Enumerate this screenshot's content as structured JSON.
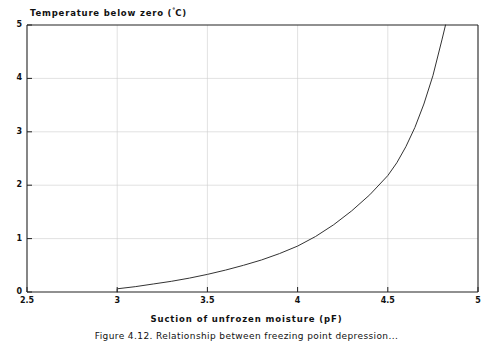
{
  "figure": {
    "caption": "Figure 4.12.  Relationship between freezing point depression..."
  },
  "chart_data": {
    "type": "line",
    "title": "",
    "xlabel": "Suction of unfrozen moisture (pF)",
    "ylabel": "Temperature below zero (°C)",
    "ylabel_text": "Temperature below zero (",
    "ylabel_unit": "C)",
    "ylabel_degree": "°",
    "xlim": [
      2.5,
      5
    ],
    "ylim": [
      0,
      5
    ],
    "xticks": [
      "2.5",
      "3",
      "3.5",
      "4",
      "4.5",
      "5"
    ],
    "xtick_values": [
      2.5,
      3,
      3.5,
      4,
      4.5,
      5
    ],
    "yticks": [
      "0",
      "1",
      "2",
      "3",
      "4",
      "5"
    ],
    "ytick_values": [
      0,
      1,
      2,
      3,
      4,
      5
    ],
    "grid": true,
    "grid_color": "#cccccc",
    "line_color": "#333333",
    "axis_color": "#222222",
    "legend": null,
    "series": [
      {
        "name": "freezing point depression",
        "x": [
          3.0,
          3.0,
          3.1,
          3.2,
          3.3,
          3.4,
          3.5,
          3.6,
          3.7,
          3.8,
          3.9,
          4.0,
          4.1,
          4.2,
          4.3,
          4.4,
          4.5,
          4.55,
          4.6,
          4.65,
          4.7,
          4.75,
          4.8,
          4.82
        ],
        "y": [
          0.0,
          0.06,
          0.1,
          0.15,
          0.2,
          0.26,
          0.33,
          0.41,
          0.5,
          0.6,
          0.72,
          0.86,
          1.04,
          1.26,
          1.52,
          1.82,
          2.18,
          2.42,
          2.72,
          3.08,
          3.52,
          4.05,
          4.72,
          5.0
        ]
      }
    ]
  }
}
